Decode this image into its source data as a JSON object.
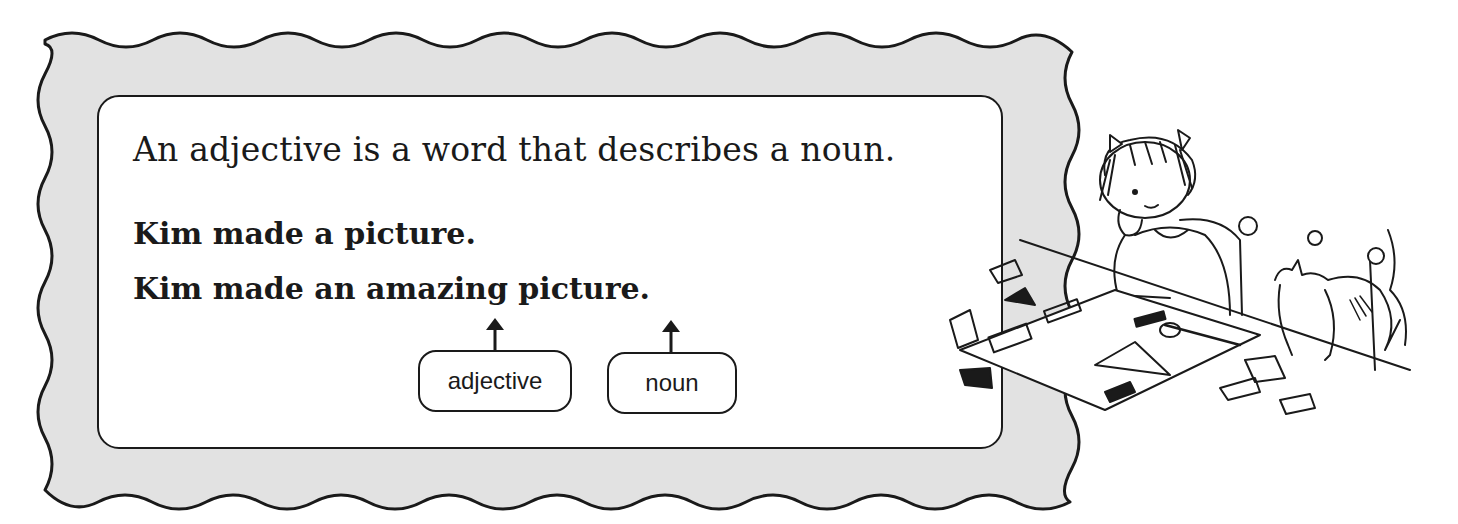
{
  "panel": {
    "definition": "An adjective is a word that describes a noun.",
    "example_plain": "Kim made a picture.",
    "example_with_adjective": "Kim made an amazing picture."
  },
  "labels": {
    "adjective": "adjective",
    "noun": "noun"
  },
  "arrows": {
    "adjective_target": "amazing",
    "noun_target": "picture"
  },
  "illustration": {
    "description": "girl with pigtails leaning on hand at a table with scattered paper cut-outs and a cat"
  },
  "colors": {
    "frame_fill": "#e2e2e2",
    "ink": "#1a1a1a",
    "card_fill": "#ffffff"
  }
}
